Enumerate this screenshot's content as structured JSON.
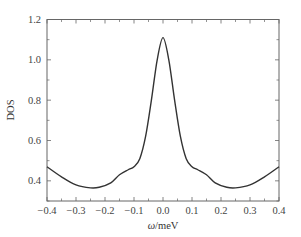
{
  "chart_data": {
    "type": "line",
    "title": "",
    "xlabel": "ω/meV",
    "ylabel": "DOS",
    "xlim": [
      -0.4,
      0.4
    ],
    "ylim": [
      0.3,
      1.2
    ],
    "grid": false,
    "legend": null,
    "x_ticks": [
      "-0.4",
      "-0.3",
      "-0.2",
      "-0.1",
      "0.0",
      "0.1",
      "0.2",
      "0.3",
      "0.4"
    ],
    "y_ticks": [
      "0.4",
      "0.6",
      "0.8",
      "1.0",
      "1.2"
    ],
    "series": [
      {
        "name": "DOS",
        "color": "#333333",
        "x": [
          -0.4,
          -0.35,
          -0.3,
          -0.25,
          -0.22,
          -0.18,
          -0.15,
          -0.12,
          -0.1,
          -0.08,
          -0.06,
          -0.04,
          -0.02,
          0.0,
          0.02,
          0.04,
          0.06,
          0.08,
          0.1,
          0.12,
          0.15,
          0.18,
          0.22,
          0.25,
          0.3,
          0.35,
          0.4
        ],
        "values": [
          0.47,
          0.42,
          0.38,
          0.365,
          0.368,
          0.39,
          0.43,
          0.455,
          0.47,
          0.51,
          0.62,
          0.8,
          1.0,
          1.11,
          1.0,
          0.8,
          0.62,
          0.51,
          0.47,
          0.455,
          0.43,
          0.39,
          0.368,
          0.365,
          0.38,
          0.42,
          0.47
        ]
      }
    ]
  }
}
